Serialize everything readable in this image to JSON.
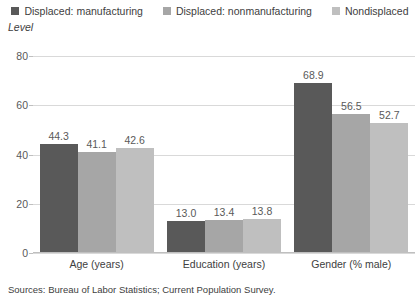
{
  "chart_data": {
    "type": "bar",
    "title": "",
    "ylabel": "Level",
    "xlabel": "",
    "categories": [
      "Age (years)",
      "Education (years)",
      "Gender (% male)"
    ],
    "series": [
      {
        "name": "Displaced: manufacturing",
        "color": "#595959",
        "values": [
          44.3,
          13.0,
          68.9
        ],
        "labels": [
          "44.3",
          "13.0",
          "68.9"
        ]
      },
      {
        "name": "Displaced: nonmanufacturing",
        "color": "#a6a6a6",
        "values": [
          41.1,
          13.4,
          56.5
        ],
        "labels": [
          "41.1",
          "13.4",
          "56.5"
        ]
      },
      {
        "name": "Nondisplaced",
        "color": "#bfbfbf",
        "values": [
          42.6,
          13.8,
          52.7
        ],
        "labels": [
          "42.6",
          "13.8",
          "52.7"
        ]
      }
    ],
    "ylim": [
      0,
      80
    ],
    "yticks": [
      0,
      20,
      40,
      60,
      80
    ],
    "ytick_labels": [
      "0",
      "20",
      "40",
      "60",
      "80"
    ],
    "grid": true,
    "legend_position": "top"
  },
  "legend": {
    "items": [
      {
        "label": "Displaced: manufacturing",
        "color": "#595959"
      },
      {
        "label": "Displaced: nonmanufacturing",
        "color": "#a6a6a6"
      },
      {
        "label": "Nondisplaced",
        "color": "#bfbfbf"
      }
    ]
  },
  "axis": {
    "y_title": "Level"
  },
  "footer": {
    "source": "Sources: Bureau of Labor Statistics; Current Population Survey."
  }
}
